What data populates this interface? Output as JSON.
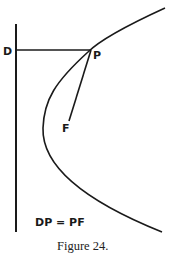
{
  "diagram": {
    "points": {
      "directrix_point": "D",
      "curve_point": "P",
      "focus": "F"
    },
    "equation": "DP = PF",
    "caption": "Figure 24.",
    "colors": {
      "ink": "#1a1a1a",
      "background": "#ffffff"
    }
  }
}
